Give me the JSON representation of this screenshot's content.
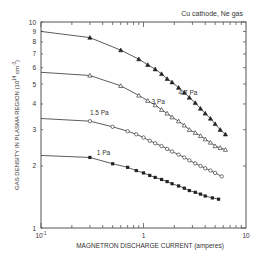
{
  "chart_data": {
    "type": "line",
    "title": "Cu cathode, Ne gas",
    "xlabel": "MAGNETRON DISCHARGE CURRENT (amperes)",
    "ylabel": "GAS DENSITY IN PLASMA REGION (10^14 cm^-3)",
    "xscale": "log",
    "yscale": "log",
    "xlim": [
      0.1,
      10
    ],
    "ylim": [
      1,
      10
    ],
    "grid": false,
    "x_tick_labels": [
      "10^-1",
      "1",
      "10"
    ],
    "y_tick_labels": [
      "1",
      "2",
      "3",
      "4",
      "5",
      "6",
      "7",
      "8",
      "9",
      "10"
    ],
    "series": [
      {
        "name": "4.7 Pa",
        "marker": "filled-triangle",
        "label_pos": {
          "x": 2.2,
          "y": 4.4
        },
        "x": [
          0.1,
          0.3,
          0.6,
          0.9,
          1.1,
          1.3,
          1.5,
          1.7,
          1.9,
          2.2,
          2.5,
          2.8,
          3.2,
          3.6,
          4.0,
          4.5,
          5.0,
          5.6,
          6.3
        ],
        "y": [
          9.0,
          8.4,
          7.3,
          6.6,
          6.2,
          5.9,
          5.6,
          5.3,
          5.1,
          4.8,
          4.55,
          4.3,
          4.05,
          3.8,
          3.6,
          3.4,
          3.2,
          3.0,
          2.85
        ]
      },
      {
        "name": "3 Pa",
        "marker": "open-triangle",
        "label_pos": {
          "x": 1.2,
          "y": 4.0
        },
        "x": [
          0.1,
          0.3,
          0.6,
          0.9,
          1.1,
          1.3,
          1.5,
          1.7,
          1.9,
          2.2,
          2.5,
          2.8,
          3.2,
          3.6,
          4.0,
          4.5,
          5.0,
          5.6,
          6.3
        ],
        "y": [
          5.7,
          5.5,
          4.9,
          4.4,
          4.15,
          3.95,
          3.75,
          3.6,
          3.45,
          3.3,
          3.15,
          3.0,
          2.9,
          2.8,
          2.7,
          2.6,
          2.5,
          2.45,
          2.4
        ]
      },
      {
        "name": "1.5 Pa",
        "marker": "open-circle",
        "label_pos": {
          "x": 0.3,
          "y": 3.55
        },
        "x": [
          0.1,
          0.3,
          0.5,
          0.7,
          0.85,
          1.0,
          1.15,
          1.3,
          1.5,
          1.7,
          1.9,
          2.2,
          2.5,
          2.8,
          3.2,
          3.6,
          4.0,
          4.5,
          5.0,
          5.8
        ],
        "y": [
          3.4,
          3.3,
          3.1,
          2.95,
          2.85,
          2.75,
          2.65,
          2.58,
          2.5,
          2.42,
          2.35,
          2.27,
          2.2,
          2.13,
          2.06,
          2.0,
          1.95,
          1.9,
          1.85,
          1.78
        ]
      },
      {
        "name": "1 Pa",
        "marker": "filled-square",
        "label_pos": {
          "x": 0.35,
          "y": 2.25
        },
        "x": [
          0.1,
          0.3,
          0.5,
          0.7,
          0.85,
          1.0,
          1.15,
          1.3,
          1.5,
          1.7,
          1.9,
          2.2,
          2.5,
          2.8,
          3.2,
          3.6,
          4.0,
          4.7,
          5.4
        ],
        "y": [
          2.25,
          2.2,
          2.05,
          1.97,
          1.9,
          1.85,
          1.8,
          1.76,
          1.72,
          1.68,
          1.64,
          1.6,
          1.56,
          1.52,
          1.49,
          1.46,
          1.43,
          1.4,
          1.38
        ]
      }
    ]
  }
}
